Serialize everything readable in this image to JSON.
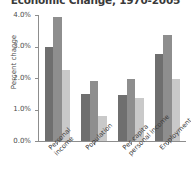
{
  "chart_data": {
    "type": "bar",
    "title": "Economic Change, 1970-2005",
    "xlabel": "",
    "ylabel": "Percent change",
    "ylim": [
      0,
      4
    ],
    "ytick_labels": [
      "0.0%",
      "1.0%",
      "2.0%",
      "3.0%",
      "4.0%"
    ],
    "ytick_values": [
      0,
      1,
      2,
      3,
      4
    ],
    "grid": false,
    "legend": "none",
    "categories": [
      "Personal income",
      "Population",
      "Per capita personal income",
      "Employment"
    ],
    "category_lines": [
      [
        "Personal",
        "income"
      ],
      [
        "Population",
        ""
      ],
      [
        "Per capita",
        "personal income"
      ],
      [
        "Employment",
        ""
      ]
    ],
    "series": [
      {
        "name": "series-1",
        "color": "#6f6f6f",
        "values": [
          3.0,
          1.5,
          1.47,
          2.75
        ]
      },
      {
        "name": "series-2",
        "color": "#8e8e8e",
        "values": [
          3.95,
          1.9,
          1.97,
          3.35
        ]
      },
      {
        "name": "series-3",
        "color": "#c9c9c9",
        "values": [
          2.25,
          0.8,
          1.37,
          1.97
        ]
      }
    ]
  }
}
